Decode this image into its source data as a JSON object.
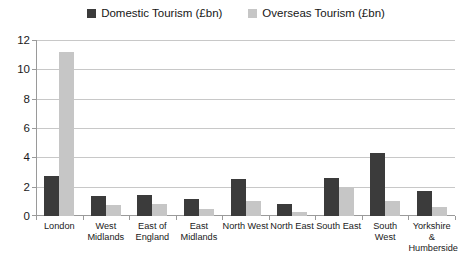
{
  "chart_data": {
    "type": "bar",
    "title": "",
    "subtitle": "",
    "xlabel": "",
    "ylabel": "",
    "ylim": [
      0,
      12
    ],
    "yticks": [
      0,
      2,
      4,
      6,
      8,
      10,
      12
    ],
    "grid": true,
    "legend_position": "top-center",
    "categories": [
      "London",
      "West\nMidlands",
      "East of\nEngland",
      "East\nMidlands",
      "North West",
      "North East",
      "South East",
      "South West",
      "Yorkshire &\nHumberside"
    ],
    "series": [
      {
        "name": "Domestic Tourism (£bn)",
        "color": "#3b3b3b",
        "values": [
          2.75,
          1.35,
          1.45,
          1.15,
          2.5,
          0.85,
          2.6,
          4.3,
          1.7
        ]
      },
      {
        "name": "Overseas Tourism (£bn)",
        "color": "#c6c6c6",
        "values": [
          11.2,
          0.75,
          0.85,
          0.45,
          1.0,
          0.25,
          1.95,
          1.05,
          0.6
        ]
      }
    ]
  },
  "legend": {
    "entries": [
      {
        "label": "Domestic Tourism (£bn)",
        "swatch_color": "#3b3b3b",
        "icon": "legend-square-icon"
      },
      {
        "label": "Overseas Tourism (£bn)",
        "swatch_color": "#c6c6c6",
        "icon": "legend-square-icon"
      }
    ]
  },
  "axis": {
    "y_tick_labels": [
      "12",
      "10",
      "8",
      "6",
      "4",
      "2",
      "0"
    ],
    "x_tick_labels": [
      "London",
      "West\nMidlands",
      "East of\nEngland",
      "East\nMidlands",
      "North West",
      "North East",
      "South East",
      "South West",
      "Yorkshire &\nHumberside"
    ]
  },
  "colors": {
    "domestic": "#3b3b3b",
    "overseas": "#c6c6c6",
    "gridline": "#c8c8c8",
    "axis": "#9a9a9a",
    "background": "#ffffff"
  }
}
